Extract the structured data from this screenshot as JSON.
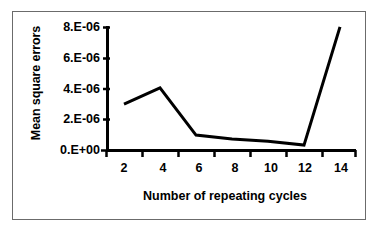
{
  "chart_data": {
    "type": "line",
    "title": "",
    "xlabel": "Number of repeating cycles",
    "ylabel": "Mean square errors",
    "x": [
      2,
      4,
      6,
      8,
      10,
      12,
      14
    ],
    "values": [
      3e-06,
      4.05e-06,
      1e-06,
      7.5e-07,
      6e-07,
      3.5e-07,
      8e-06
    ],
    "series": [
      {
        "name": "Mean square errors",
        "values": [
          3e-06,
          4.05e-06,
          1e-06,
          7.5e-07,
          6e-07,
          3.5e-07,
          8e-06
        ]
      }
    ],
    "xtick_labels": [
      "2",
      "4",
      "6",
      "8",
      "10",
      "12",
      "14"
    ],
    "ytick_labels": [
      "0.E+00",
      "2.E-06",
      "4.E-06",
      "6.E-06",
      "8.E-06"
    ],
    "ytick_values": [
      0.0,
      2e-06,
      4e-06,
      6e-06,
      8e-06
    ],
    "xlim": [
      1,
      15
    ],
    "ylim": [
      0,
      8e-06
    ],
    "grid": false,
    "legend": "none",
    "line_color": "#000000"
  },
  "axis": {
    "y_title": "Mean square errors",
    "x_title": "Number of repeating cycles",
    "y_labels": [
      "8.E-06",
      "6.E-06",
      "4.E-06",
      "2.E-06",
      "0.E+00"
    ],
    "x_labels": [
      "2",
      "4",
      "6",
      "8",
      "10",
      "12",
      "14"
    ]
  },
  "colors": {
    "line": "#000000",
    "axis": "#000000",
    "frame": "#6b6b6b",
    "background": "#ffffff"
  }
}
